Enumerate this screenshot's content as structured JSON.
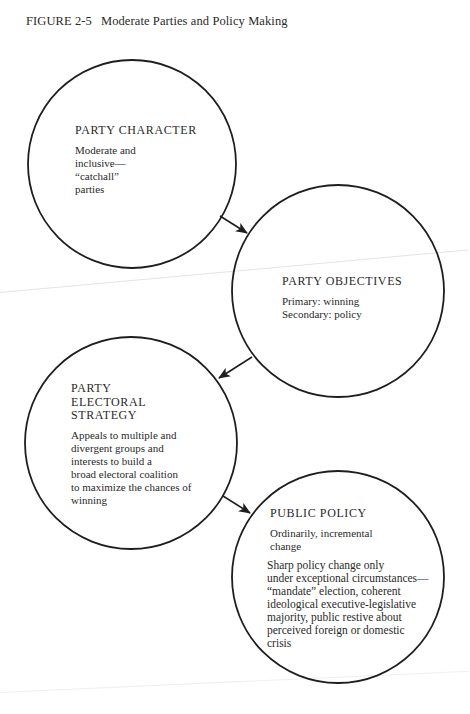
{
  "caption": {
    "figure_label": "FIGURE 2-5",
    "title": "Moderate Parties and Policy Making"
  },
  "nodes": [
    {
      "title": "PARTY CHARACTER",
      "paragraphs": [
        "Moderate and\ninclusive—\n“catchall”\nparties"
      ]
    },
    {
      "title": "PARTY OBJECTIVES",
      "paragraphs": [
        "Primary: winning\nSecondary: policy"
      ]
    },
    {
      "title": "PARTY\nELECTORAL\nSTRATEGY",
      "paragraphs": [
        "Appeals to multiple and\ndivergent groups and\ninterests to build a\nbroad electoral coalition\nto maximize the chances of\nwinning"
      ]
    },
    {
      "title": "PUBLIC POLICY",
      "paragraphs": [
        "Ordinarily, incremental\nchange",
        "Sharp policy change only\nunder exceptional circumstances—\n“mandate” election, coherent\nideological executive-legislative\nmajority, public restive about\nperceived foreign or domestic\ncrisis"
      ]
    }
  ],
  "edges": [
    {
      "from": "PARTY CHARACTER",
      "to": "PARTY OBJECTIVES"
    },
    {
      "from": "PARTY OBJECTIVES",
      "to": "PARTY ELECTORAL STRATEGY"
    },
    {
      "from": "PARTY ELECTORAL STRATEGY",
      "to": "PUBLIC POLICY"
    }
  ],
  "colors": {
    "ink": "#1e1e1e",
    "paper": "#ffffff"
  }
}
